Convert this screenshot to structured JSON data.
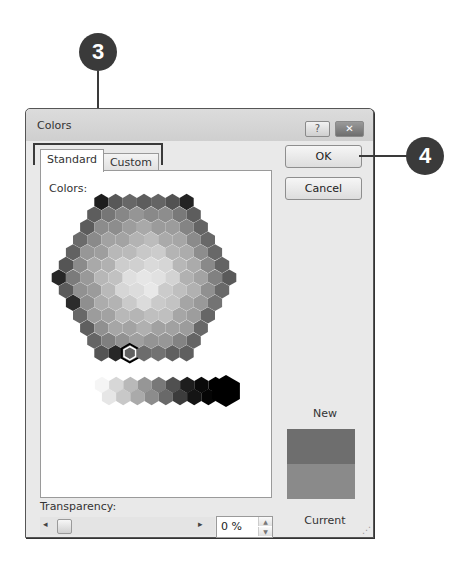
{
  "callouts": [
    {
      "number": "3",
      "target": "tabs"
    },
    {
      "number": "4",
      "target": "ok-button"
    }
  ],
  "dialog": {
    "title": "Colors",
    "help_glyph": "?",
    "close_glyph": "✕",
    "tabs": [
      {
        "label": "Standard",
        "active": true
      },
      {
        "label": "Custom",
        "active": false
      }
    ],
    "colors_label": "Colors:",
    "colors_label_accel": "C",
    "ok_label": "OK",
    "cancel_label": "Cancel",
    "new_label": "New",
    "current_label": "Current",
    "new_color": "#6e6e6e",
    "current_color": "#8a8a8a",
    "transparency_label": "Transparency:",
    "transparency_accel": "T",
    "transparency_value": "0 %",
    "slider_left_glyph": "◂",
    "slider_right_glyph": "▸",
    "spin_up_glyph": "▲",
    "spin_down_glyph": "▼",
    "grip_glyph": "⋰"
  }
}
